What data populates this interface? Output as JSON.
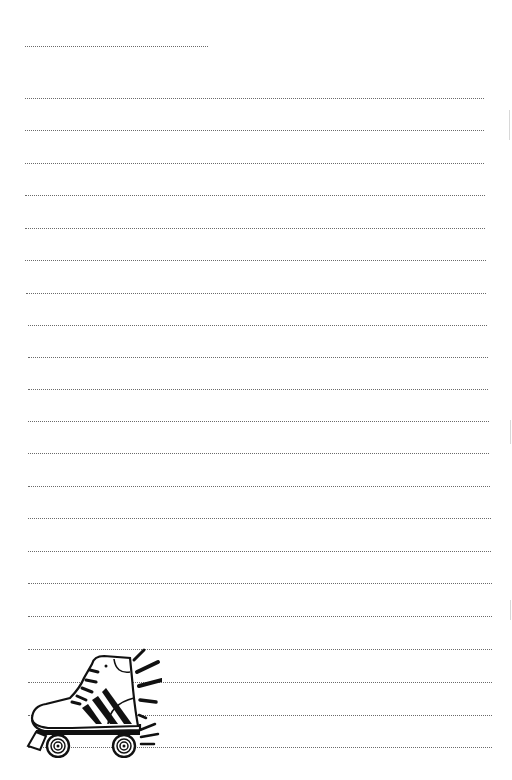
{
  "document": {
    "type": "lined writing paper",
    "name_line": {
      "y": 46,
      "x_start": 25,
      "x_end": 208
    },
    "ruled_lines": {
      "count": 21,
      "positions": [
        {
          "y": 98,
          "x_start": 25,
          "x_end": 484
        },
        {
          "y": 130,
          "x_start": 25,
          "x_end": 484
        },
        {
          "y": 163,
          "x_start": 25,
          "x_end": 484
        },
        {
          "y": 195,
          "x_start": 25,
          "x_end": 485
        },
        {
          "y": 228,
          "x_start": 25,
          "x_end": 485
        },
        {
          "y": 260,
          "x_start": 25,
          "x_end": 486
        },
        {
          "y": 293,
          "x_start": 26,
          "x_end": 486
        },
        {
          "y": 325,
          "x_start": 28,
          "x_end": 487
        },
        {
          "y": 357,
          "x_start": 28,
          "x_end": 488
        },
        {
          "y": 389,
          "x_start": 28,
          "x_end": 488
        },
        {
          "y": 421,
          "x_start": 28,
          "x_end": 489
        },
        {
          "y": 453,
          "x_start": 28,
          "x_end": 489
        },
        {
          "y": 486,
          "x_start": 28,
          "x_end": 490
        },
        {
          "y": 518,
          "x_start": 28,
          "x_end": 491
        },
        {
          "y": 551,
          "x_start": 28,
          "x_end": 491
        },
        {
          "y": 583,
          "x_start": 28,
          "x_end": 492
        },
        {
          "y": 616,
          "x_start": 28,
          "x_end": 492
        },
        {
          "y": 649,
          "x_start": 28,
          "x_end": 492
        },
        {
          "y": 682,
          "x_start": 28,
          "x_end": 492
        },
        {
          "y": 715,
          "x_start": 28,
          "x_end": 492
        },
        {
          "y": 747,
          "x_start": 28,
          "x_end": 492
        }
      ]
    },
    "illustration": {
      "icon": "roller-skate-icon",
      "position": "bottom-left"
    },
    "colors": {
      "paper": "#ffffff",
      "rule": "#6a6a6a",
      "ink": "#111111"
    }
  }
}
